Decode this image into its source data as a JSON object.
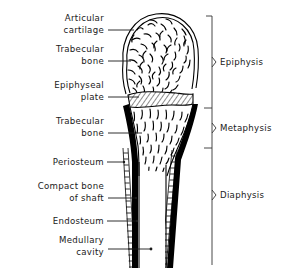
{
  "figure": {
    "background_color": "#ffffff",
    "ink_color": "#000000"
  },
  "left_labels": [
    {
      "id": "articular-cartilage",
      "lines": [
        "Articular",
        "cartilage"
      ],
      "text": "Articular cartilage"
    },
    {
      "id": "trabecular-bone-epiphysis",
      "lines": [
        "Trabecular",
        "bone"
      ],
      "text": "Trabecular bone"
    },
    {
      "id": "epiphyseal-plate",
      "lines": [
        "Epiphyseal",
        "plate"
      ],
      "text": "Epiphyseal plate"
    },
    {
      "id": "trabecular-bone-metaphysis",
      "lines": [
        "Trabecular",
        "bone"
      ],
      "text": "Trabecular bone"
    },
    {
      "id": "periosteum",
      "lines": [
        "Periosteum"
      ],
      "text": "Periosteum"
    },
    {
      "id": "compact-bone-of-shaft",
      "lines": [
        "Compact bone",
        "of shaft"
      ],
      "text": "Compact bone of shaft"
    },
    {
      "id": "endosteum",
      "lines": [
        "Endosteum"
      ],
      "text": "Endosteum"
    },
    {
      "id": "medullary-cavity",
      "lines": [
        "Medullary",
        "cavity"
      ],
      "text": "Medullary cavity"
    }
  ],
  "right_labels": [
    {
      "id": "epiphysis",
      "text": "Epiphysis"
    },
    {
      "id": "metaphysis",
      "text": "Metaphysis"
    },
    {
      "id": "diaphysis",
      "text": "Diaphysis"
    }
  ]
}
